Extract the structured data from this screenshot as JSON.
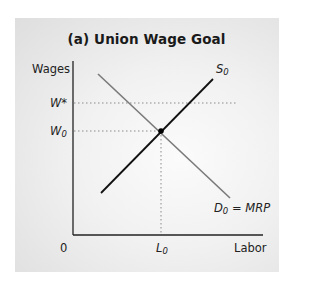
{
  "figure": {
    "title": "(a) Union Wage Goal",
    "y_axis_label": "Wages",
    "x_axis_label": "Labor",
    "origin_label": "0",
    "y_ticks": [
      {
        "label": "W*",
        "level": "union wage goal"
      },
      {
        "label": "W",
        "sub": "0",
        "level": "equilibrium wage"
      }
    ],
    "x_ticks": [
      {
        "label": "L",
        "sub": "0",
        "level": "equilibrium labor"
      }
    ],
    "curves": [
      {
        "name": "S",
        "sub": "0",
        "type": "supply",
        "color": "#111111"
      },
      {
        "name": "D",
        "sub": "0",
        "suffix": " = MRP",
        "type": "demand",
        "color": "#7a7a7a"
      }
    ],
    "equilibrium_point": {
      "x_label": "L0",
      "y_label": "W0"
    }
  },
  "colors": {
    "background_panel": "#ececec",
    "supply": "#111111",
    "demand": "#7a7a7a",
    "axes": "#222222",
    "guides": "#8a8a8a"
  }
}
